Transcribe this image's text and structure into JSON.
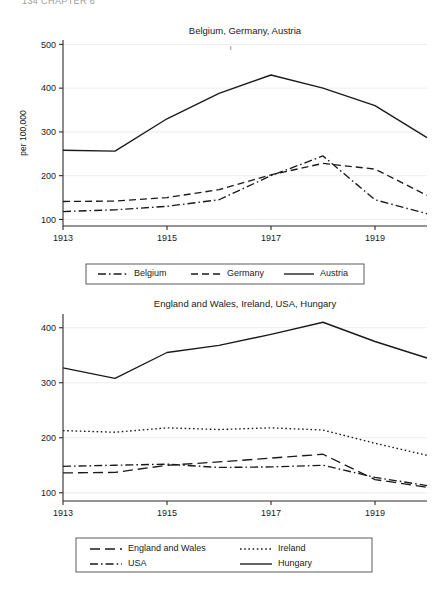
{
  "page": {
    "header_text": "134   CHAPTER 6"
  },
  "chart_data": [
    {
      "id": "chart-top",
      "type": "line",
      "title": "Belgium, Germany, Austria",
      "xlabel": "",
      "ylabel": "per 100,000",
      "x": [
        1913,
        1914,
        1915,
        1916,
        1917,
        1918,
        1919,
        1920
      ],
      "xticks": [
        1913,
        1915,
        1917,
        1919
      ],
      "xlim": [
        1913,
        1920
      ],
      "yticks": [
        100,
        200,
        300,
        400,
        500
      ],
      "ylim": [
        85,
        510
      ],
      "grid": true,
      "legend_position": "bottom",
      "series": [
        {
          "name": "Belgium",
          "dash": "dash-dot",
          "values": [
            118,
            122,
            130,
            145,
            200,
            245,
            145,
            113
          ]
        },
        {
          "name": "Germany",
          "dash": "dashed",
          "values": [
            141,
            142,
            150,
            168,
            202,
            228,
            215,
            155
          ]
        },
        {
          "name": "Austria",
          "dash": "solid",
          "values": [
            258,
            256,
            330,
            388,
            430,
            400,
            360,
            287
          ]
        }
      ]
    },
    {
      "id": "chart-bottom",
      "type": "line",
      "title": "England and Wales, Ireland, USA, Hungary",
      "xlabel": "",
      "ylabel": "",
      "x": [
        1913,
        1914,
        1915,
        1916,
        1917,
        1918,
        1919,
        1920
      ],
      "xticks": [
        1913,
        1915,
        1917,
        1919
      ],
      "xlim": [
        1913,
        1920
      ],
      "yticks": [
        100,
        200,
        300,
        400
      ],
      "ylim": [
        85,
        425
      ],
      "grid": true,
      "legend_position": "bottom",
      "series": [
        {
          "name": "England and Wales",
          "dash": "long-dash",
          "values": [
            136,
            137,
            150,
            156,
            163,
            170,
            124,
            110
          ]
        },
        {
          "name": "Ireland",
          "dash": "dotted",
          "values": [
            213,
            210,
            218,
            215,
            218,
            214,
            190,
            168
          ]
        },
        {
          "name": "USA",
          "dash": "dash-dot",
          "values": [
            148,
            150,
            152,
            146,
            147,
            150,
            128,
            113
          ]
        },
        {
          "name": "Hungary",
          "dash": "solid",
          "values": [
            327,
            308,
            355,
            368,
            388,
            410,
            375,
            345
          ]
        }
      ]
    }
  ]
}
